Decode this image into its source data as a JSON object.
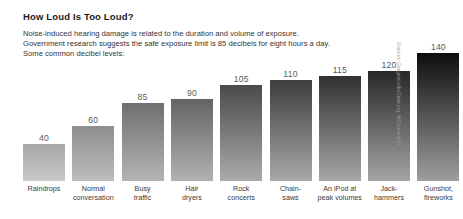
{
  "header": {
    "title": "How Loud Is Too Loud?",
    "subtitle_lines": [
      "Noise-induced hearing damage is related to the duration and volume of exposure.",
      "Government research suggests the safe exposure limit is 85 decibels for eight hours a day.",
      "Some common decibel levels:"
    ]
  },
  "source": "Sources: Gangemi.edu/Dunn.org; WSJ research",
  "chart_data": {
    "type": "bar",
    "title": "How Loud Is Too Loud?",
    "xlabel": "",
    "ylabel": "",
    "ylim": [
      0,
      140
    ],
    "grid": false,
    "legend": false,
    "unit": "decibels",
    "categories": [
      "Raindrops",
      "Normal conversation",
      "Busy traffic",
      "Hair dryers",
      "Rock concerts",
      "Chain-saws",
      "An iPod at peak volumes",
      "Jack-hammers",
      "Gunshot, fireworks"
    ],
    "category_lines": [
      [
        "Raindrops",
        ""
      ],
      [
        "Normal",
        "conversation"
      ],
      [
        "Busy",
        "traffic"
      ],
      [
        "Hair",
        "dryers"
      ],
      [
        "Rock",
        "concerts"
      ],
      [
        "Chain-",
        "saws"
      ],
      [
        "An iPod at",
        "peak volumes"
      ],
      [
        "Jack-",
        "hammers"
      ],
      [
        "Gunshot,",
        "fireworks"
      ]
    ],
    "values": [
      40,
      60,
      85,
      90,
      105,
      110,
      115,
      120,
      140
    ],
    "value_labels": [
      "40",
      "60",
      "85",
      "90",
      "105",
      "110",
      "115",
      "120",
      "140"
    ],
    "bar_gradient_top": [
      "#a8a8a8",
      "#8d8d8d",
      "#6f6f6f",
      "#646464",
      "#4a4a4a",
      "#3d3d3d",
      "#313131",
      "#272727",
      "#0d0d0d"
    ],
    "bar_gradient_bottom": [
      "#c9c9c9",
      "#bdbdbd",
      "#b4b4b4",
      "#b2b2b2",
      "#ababab",
      "#a9a9a9",
      "#a7a7a7",
      "#a5a5a5",
      "#9e9e9e"
    ]
  }
}
